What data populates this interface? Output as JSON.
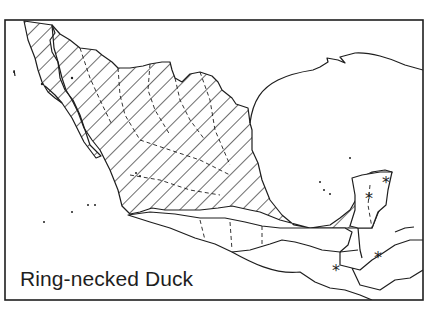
{
  "map": {
    "title": "Ring-necked Duck",
    "region": "Mexico and northern Central America",
    "legend": {
      "hatched": "range",
      "star": "isolated record"
    },
    "colors": {
      "line": "#1e1e1e",
      "background": "#ffffff"
    },
    "stars": [
      {
        "x": 386,
        "y": 182
      },
      {
        "x": 369,
        "y": 198
      },
      {
        "x": 378,
        "y": 257
      },
      {
        "x": 336,
        "y": 270
      }
    ]
  }
}
